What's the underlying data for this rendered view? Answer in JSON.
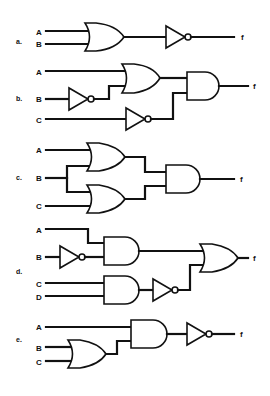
{
  "figure": {
    "output_label": "f",
    "circuits": [
      {
        "label": "a.",
        "inputs": [
          "A",
          "B"
        ],
        "gates": [
          "OR(A,B)",
          "NOT"
        ],
        "expression": "f = NOT(A OR B)"
      },
      {
        "label": "b.",
        "inputs": [
          "A",
          "B",
          "C"
        ],
        "gates": [
          "NOT(B)",
          "OR(A, NOT B)",
          "NOT(C)",
          "AND"
        ],
        "expression": "f = (A OR NOT B) AND NOT C"
      },
      {
        "label": "c.",
        "inputs": [
          "A",
          "B",
          "C"
        ],
        "gates": [
          "OR(A,B)",
          "OR(B,C)",
          "AND"
        ],
        "expression": "f = (A OR B) AND (B OR C)"
      },
      {
        "label": "d.",
        "inputs": [
          "A",
          "B",
          "C",
          "D"
        ],
        "gates": [
          "NOT(B)",
          "AND(A, NOT B)",
          "AND(C,D)",
          "NOT",
          "OR"
        ],
        "expression": "f = (A AND NOT B) OR NOT(C AND D)"
      },
      {
        "label": "e.",
        "inputs": [
          "A",
          "B",
          "C"
        ],
        "gates": [
          "OR(B,C)",
          "AND(A, B OR C)",
          "NOT"
        ],
        "expression": "f = NOT(A AND (B OR C))"
      }
    ]
  },
  "colors": {
    "ink": "#111111",
    "background": "#ffffff"
  }
}
